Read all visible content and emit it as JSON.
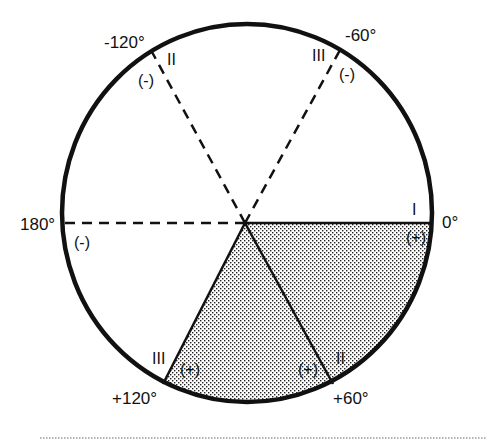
{
  "diagram": {
    "type": "phasor-circle",
    "colors": {
      "stroke": "#111111",
      "shade_dot": "#222222",
      "background": "#ffffff",
      "footer_rule": "#999999"
    },
    "angles": [
      {
        "id": "a0",
        "label": "0°",
        "degrees": 0,
        "line": "solid",
        "sector_label": "I",
        "sign": "(+)"
      },
      {
        "id": "am60",
        "label": "-60°",
        "degrees": -60,
        "line": "dashed",
        "sector_label": "III",
        "sign": "(-)"
      },
      {
        "id": "am120",
        "label": "-120°",
        "degrees": -120,
        "line": "dashed",
        "sector_label": "II",
        "sign": "(-)"
      },
      {
        "id": "a180",
        "label": "180°",
        "degrees": 180,
        "line": "dashed",
        "sector_label": "",
        "sign": "(-)"
      },
      {
        "id": "ap120",
        "label": "+120°",
        "degrees": 120,
        "line": "solid",
        "sector_label": "III",
        "sign": "(+)"
      },
      {
        "id": "ap60",
        "label": "+60°",
        "degrees": 60,
        "line": "solid",
        "sector_label": "II",
        "sign": "(+)"
      }
    ],
    "shaded_region": "sector from 0° to +120° (stippled)"
  }
}
